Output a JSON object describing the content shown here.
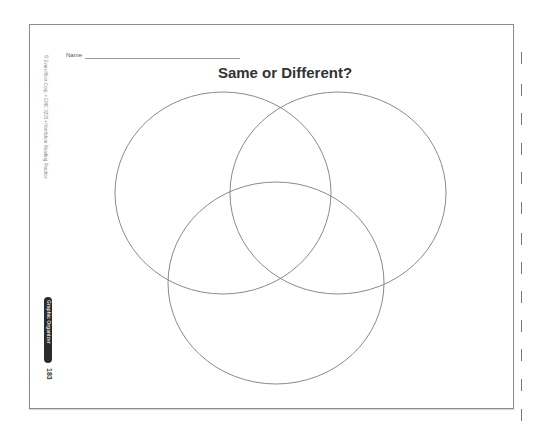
{
  "worksheet": {
    "name_label": "Name",
    "title": "Same or Different?",
    "copyright": "© Evan-Moor Corp. • EMC 3233 • Nonfiction Reading Practice",
    "section_badge": "Graphic Organizer",
    "page_number": "183"
  },
  "venn": {
    "stroke_color": "#8a8a8a",
    "circles": [
      {
        "id": "left",
        "cx": 223,
        "cy": 193,
        "rx": 108,
        "ry": 101
      },
      {
        "id": "right",
        "cx": 338,
        "cy": 193,
        "rx": 108,
        "ry": 101
      },
      {
        "id": "bottom",
        "cx": 276,
        "cy": 283,
        "rx": 108,
        "ry": 101
      }
    ]
  },
  "cut_marks": [
    {
      "y": 52
    },
    {
      "y": 84
    },
    {
      "y": 113
    },
    {
      "y": 143
    },
    {
      "y": 172
    },
    {
      "y": 202
    },
    {
      "y": 233
    },
    {
      "y": 262
    },
    {
      "y": 291
    },
    {
      "y": 320
    },
    {
      "y": 349
    },
    {
      "y": 379
    },
    {
      "y": 409
    }
  ]
}
